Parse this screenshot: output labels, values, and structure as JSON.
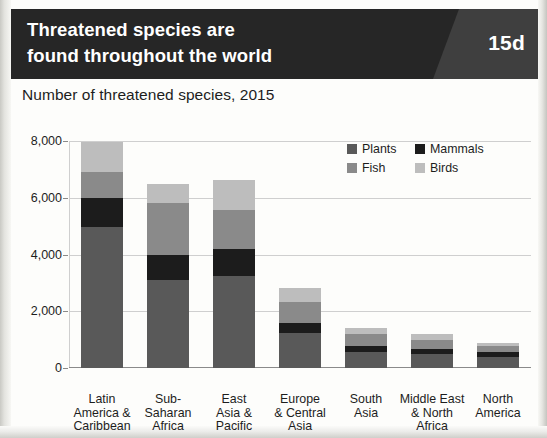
{
  "header": {
    "title_line1": "Threatened species are",
    "title_line2": "found throughout the world",
    "badge": "15d",
    "background_color": "#262626",
    "badge_panel_color": "#3f3f3f"
  },
  "subtitle": "Number of threatened species, 2015",
  "chart_data": {
    "type": "bar",
    "subtype": "stacked-vertical",
    "title": "Threatened species are found throughout the world",
    "subtitle": "Number of threatened species, 2015",
    "xlabel": "",
    "ylabel": "",
    "ylim": [
      0,
      8000
    ],
    "yticks": [
      0,
      2000,
      4000,
      6000,
      8000
    ],
    "ytick_labels": [
      "0",
      "2,000",
      "4,000",
      "6,000",
      "8,000"
    ],
    "grid": true,
    "grid_axis": "y",
    "legend_position": "top-right",
    "categories": [
      "Latin America & Caribbean",
      "Sub-Saharan Africa",
      "East Asia & Pacific",
      "Europe & Central Asia",
      "South Asia",
      "Middle East & North Africa",
      "North America"
    ],
    "category_label_lines": [
      [
        "Latin",
        "America &",
        "Caribbean"
      ],
      [
        "Sub-",
        "Saharan",
        "Africa"
      ],
      [
        "East",
        "Asia &",
        "Pacific"
      ],
      [
        "Europe",
        "& Central",
        "Asia"
      ],
      [
        "South",
        "Asia"
      ],
      [
        "Middle East",
        "& North",
        "Africa"
      ],
      [
        "North",
        "America"
      ]
    ],
    "series": [
      {
        "name": "Plants",
        "color": "#595959",
        "values": [
          4970,
          3100,
          3250,
          1250,
          560,
          500,
          390
        ]
      },
      {
        "name": "Mammals",
        "color": "#1c1c1c",
        "values": [
          1020,
          880,
          950,
          320,
          220,
          170,
          170
        ]
      },
      {
        "name": "Fish",
        "color": "#8a8a8a",
        "values": [
          920,
          1830,
          1380,
          760,
          420,
          330,
          200
        ]
      },
      {
        "name": "Birds",
        "color": "#bdbdbd",
        "values": [
          1060,
          670,
          1060,
          500,
          210,
          190,
          120
        ]
      }
    ],
    "totals": [
      7970,
      6480,
      6640,
      2830,
      1410,
      1190,
      880
    ]
  }
}
